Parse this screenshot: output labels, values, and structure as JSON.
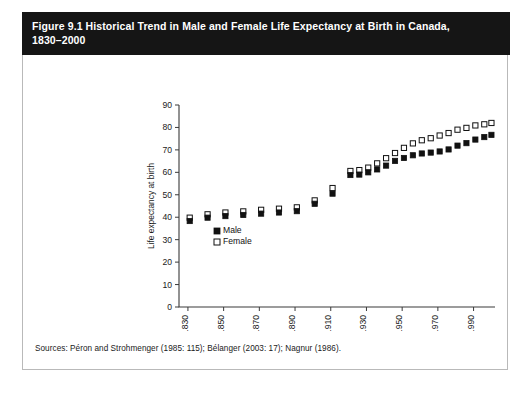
{
  "figure": {
    "title_line1": "Figure 9.1 Historical Trend in Male and Female Life Expectancy at Birth in Canada,",
    "title_line2": "1830–2000",
    "source": "Sources: Péron and Strohmenger (1985: 115); Bélanger (2003: 17); Nagnur (1986).",
    "title_bg": "#151515",
    "title_fg": "#ffffff",
    "border_color": "#b9b9b9"
  },
  "legend": {
    "male_label": "Male",
    "female_label": "Female",
    "male_color": "#111111",
    "female_color": "#ffffff"
  },
  "chart_data": {
    "type": "scatter",
    "title": "Figure 9.1 Historical Trend in Male and Female Life Expectancy at Birth in Canada, 1830–2000",
    "xlabel": "",
    "ylabel": "Life expectancy at birth",
    "xlim": [
      1825,
      2002
    ],
    "ylim": [
      0,
      90
    ],
    "yticks": [
      0,
      10,
      20,
      30,
      40,
      50,
      60,
      70,
      80,
      90
    ],
    "xticks": [
      1830,
      1850,
      1870,
      1890,
      1910,
      1930,
      1950,
      1970,
      1990
    ],
    "xticklabels": [
      "1830",
      "1850",
      "1870",
      "1890",
      "1910",
      "1930",
      "1950",
      "1970",
      "1990"
    ],
    "yticklabels": [
      "0",
      "10",
      "20",
      "30",
      "40",
      "50",
      "60",
      "70",
      "80",
      "90"
    ],
    "grid": false,
    "legend_position": "inside-lower-left",
    "series": [
      {
        "name": "Male",
        "marker": "filled-square",
        "x": [
          1831,
          1841,
          1851,
          1861,
          1871,
          1881,
          1891,
          1901,
          1911,
          1921,
          1926,
          1931,
          1936,
          1941,
          1946,
          1951,
          1956,
          1961,
          1966,
          1971,
          1976,
          1981,
          1986,
          1991,
          1996,
          2000
        ],
        "y": [
          38.3,
          39.8,
          40.5,
          41.0,
          41.6,
          42.1,
          42.7,
          46.0,
          50.5,
          58.8,
          59.0,
          60.0,
          61.3,
          63.0,
          65.1,
          66.4,
          67.6,
          68.4,
          68.8,
          69.3,
          70.2,
          71.9,
          73.0,
          74.6,
          75.7,
          76.7
        ],
        "label_unit": "years"
      },
      {
        "name": "Female",
        "marker": "open-square",
        "x": [
          1831,
          1841,
          1851,
          1861,
          1871,
          1881,
          1891,
          1901,
          1911,
          1921,
          1926,
          1931,
          1936,
          1941,
          1946,
          1951,
          1956,
          1961,
          1966,
          1971,
          1976,
          1981,
          1986,
          1991,
          1996,
          2000
        ],
        "y": [
          39.8,
          41.3,
          42.1,
          42.6,
          43.3,
          43.8,
          44.4,
          47.5,
          53.0,
          60.6,
          61.0,
          62.1,
          64.0,
          66.3,
          68.6,
          70.9,
          72.9,
          74.3,
          75.2,
          76.4,
          77.5,
          79.0,
          79.8,
          80.9,
          81.4,
          82.0
        ],
        "label_unit": "years"
      }
    ]
  }
}
